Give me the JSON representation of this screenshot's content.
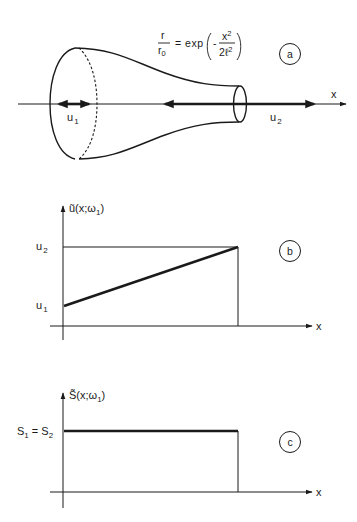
{
  "panel_a": {
    "equation": {
      "lhs_num": "r",
      "lhs_den": "r",
      "lhs_den_sub": "0",
      "eq": "=",
      "func": "exp",
      "minus": "-",
      "frac_num": "x",
      "frac_num_sup": "2",
      "frac_den": "2ℓ",
      "frac_den_sup": "2"
    },
    "badge": "a",
    "axis_label": "x",
    "u1_label": "u",
    "u1_sub": "1",
    "u2_label": "u",
    "u2_sub": "2"
  },
  "panel_b": {
    "badge": "b",
    "y_label": "ũ(x;ω",
    "y_label_sub": "1",
    "y_label_close": ")",
    "x_label": "x",
    "tick_u2": "u",
    "tick_u2_sub": "2",
    "tick_u1": "u",
    "tick_u1_sub": "1"
  },
  "panel_c": {
    "badge": "c",
    "y_label": "S̃(x;ω",
    "y_label_sub": "1",
    "y_label_close": ")",
    "x_label": "x",
    "tick_s": "S",
    "tick_s_sub1": "1",
    "tick_s_eq": " = S",
    "tick_s_sub2": "2"
  },
  "colors": {
    "ink": "#1a1a1a",
    "background": "#ffffff"
  }
}
